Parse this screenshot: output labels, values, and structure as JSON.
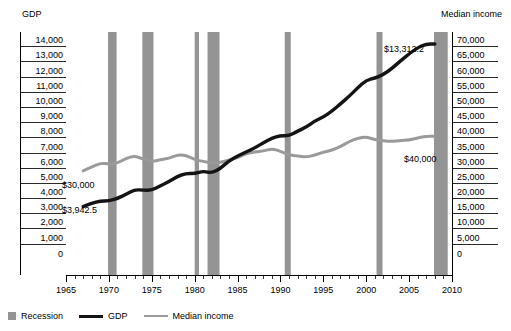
{
  "chart_data": {
    "type": "line",
    "title": "",
    "xlabel": "",
    "x": [
      1965,
      1966,
      1967,
      1968,
      1969,
      1970,
      1971,
      1972,
      1973,
      1974,
      1975,
      1976,
      1977,
      1978,
      1979,
      1980,
      1981,
      1982,
      1983,
      1984,
      1985,
      1986,
      1987,
      1988,
      1989,
      1990,
      1991,
      1992,
      1993,
      1994,
      1995,
      1996,
      1997,
      1998,
      1999,
      2000,
      2001,
      2002,
      2003,
      2004,
      2005,
      2006,
      2007,
      2008,
      2009
    ],
    "xlim": [
      1965,
      2010
    ],
    "xticks_major": [
      1965,
      1970,
      1975,
      1980,
      1985,
      1990,
      1995,
      2000,
      2005,
      2010
    ],
    "xtick_labels": [
      "1965",
      "1970",
      "1975",
      "1980",
      "1985",
      "1990",
      "1995",
      "2000",
      "2005",
      "2010"
    ],
    "xtick_minor_step": 1,
    "grid": false,
    "legend_position": "bottom-left",
    "axes": [
      {
        "id": "left",
        "name": "GDP",
        "title": "GDP",
        "ylim": [
          0,
          14000
        ],
        "yticks": [
          0,
          1000,
          2000,
          3000,
          4000,
          5000,
          6000,
          7000,
          8000,
          9000,
          10000,
          11000,
          12000,
          13000,
          14000
        ],
        "ytick_labels": [
          "0",
          "1,000",
          "2,000",
          "3,000",
          "4,000",
          "5,000",
          "6,000",
          "7,000",
          "8,000",
          "9,000",
          "10,000",
          "11,000",
          "12,000",
          "13,000",
          "14,000"
        ]
      },
      {
        "id": "right",
        "name": "Median income",
        "title": "Median income",
        "ylim": [
          0,
          70000
        ],
        "yticks": [
          0,
          5000,
          10000,
          15000,
          20000,
          25000,
          30000,
          35000,
          40000,
          45000,
          50000,
          55000,
          60000,
          65000,
          70000
        ],
        "ytick_labels": [
          "0",
          "5,000",
          "10,000",
          "15,000",
          "20,000",
          "25,000",
          "30,000",
          "35,000",
          "40,000",
          "45,000",
          "50,000",
          "55,000",
          "60,000",
          "65,000",
          "70,000"
        ]
      }
    ],
    "series": [
      {
        "name": "GDP",
        "axis": "left",
        "color": "#141414",
        "width": 3.4,
        "units": "billions of dollars",
        "x": [
          1967,
          1968,
          1969,
          1970,
          1971,
          1972,
          1973,
          1974,
          1975,
          1976,
          1977,
          1978,
          1979,
          1980,
          1981,
          1982,
          1983,
          1984,
          1985,
          1986,
          1987,
          1988,
          1989,
          1990,
          1991,
          1992,
          1993,
          1994,
          1995,
          1996,
          1997,
          1998,
          1999,
          2000,
          2001,
          2002,
          2003,
          2004,
          2005,
          2006,
          2007,
          2008
        ],
        "values": [
          3942.5,
          4133,
          4262,
          4270,
          4413,
          4648,
          4917,
          4890,
          4880,
          5140,
          5378,
          5678,
          5855,
          5840,
          5990,
          5870,
          6140,
          6580,
          6850,
          7090,
          7320,
          7620,
          7890,
          8030,
          8010,
          8290,
          8520,
          8870,
          9100,
          9440,
          9860,
          10290,
          10780,
          11220,
          11340,
          11550,
          11900,
          12340,
          12740,
          13100,
          13312.2,
          13312.2
        ],
        "start_label": "$3,942.5",
        "end_label": "$13,312.2"
      },
      {
        "name": "Median income",
        "axis": "right",
        "color": "#9a9a9a",
        "width": 3.0,
        "units": "dollars",
        "x": [
          1967,
          1968,
          1969,
          1970,
          1971,
          1972,
          1973,
          1974,
          1975,
          1976,
          1977,
          1978,
          1979,
          1980,
          1981,
          1982,
          1983,
          1984,
          1985,
          1986,
          1987,
          1988,
          1989,
          1990,
          1991,
          1992,
          1993,
          1994,
          1995,
          1996,
          1997,
          1998,
          1999,
          2000,
          2001,
          2002,
          2003,
          2004,
          2005,
          2006,
          2007,
          2008
        ],
        "values": [
          30000,
          31100,
          32200,
          32000,
          32200,
          33600,
          34300,
          33400,
          32600,
          33200,
          33600,
          34600,
          34500,
          33200,
          32700,
          32300,
          32400,
          33100,
          33800,
          35000,
          35400,
          35700,
          36400,
          35700,
          34500,
          34300,
          34000,
          34500,
          35400,
          35900,
          37000,
          38400,
          39400,
          39800,
          39000,
          38600,
          38500,
          38700,
          38900,
          39500,
          40000,
          40000
        ],
        "start_label": "$30,000",
        "end_label": "$40,000"
      }
    ],
    "recessions": [
      {
        "label": "Recession",
        "start": 1969.9,
        "end": 1970.9
      },
      {
        "label": "Recession",
        "start": 1973.9,
        "end": 1975.2
      },
      {
        "label": "Recession",
        "start": 1980.0,
        "end": 1980.5
      },
      {
        "label": "Recession",
        "start": 1981.5,
        "end": 1982.9
      },
      {
        "label": "Recession",
        "start": 1990.5,
        "end": 1991.2
      },
      {
        "label": "Recession",
        "start": 2001.2,
        "end": 2001.9
      },
      {
        "label": "Recession",
        "start": 2007.9,
        "end": 2009.5
      }
    ],
    "recession_color": "#949494"
  },
  "annotations": {
    "gdp_start": "$3,942.5",
    "gdp_end": "$13,312.2",
    "income_start": "$30,000",
    "income_end": "$40,000"
  },
  "legend": {
    "items": [
      {
        "label": "Recession",
        "style": "box",
        "color": "#949494"
      },
      {
        "label": "GDP",
        "style": "line",
        "color": "#141414"
      },
      {
        "label": "Median income",
        "style": "line-thin",
        "color": "#9a9a9a"
      }
    ]
  }
}
